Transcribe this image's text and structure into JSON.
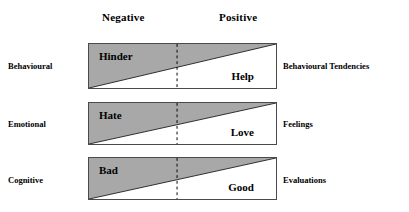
{
  "diagram": {
    "column_headers": {
      "negative": "Negative",
      "positive": "Positive"
    },
    "colors": {
      "negative_fill": "#a8a8a8",
      "positive_fill": "#ffffff",
      "box_border": "#4a4a4a",
      "divider": "#000000",
      "text": "#000000"
    },
    "divider": {
      "style": "dashed",
      "position_percent": 47
    },
    "rows": [
      {
        "id": "behavioural",
        "left_label": "Behavioural",
        "negative_word": "Hinder",
        "positive_word": "Help",
        "right_label": "Behavioural Tendencies"
      },
      {
        "id": "emotional",
        "left_label": "Emotional",
        "negative_word": "Hate",
        "positive_word": "Love",
        "right_label": "Feelings"
      },
      {
        "id": "cognitive",
        "left_label": "Cognitive",
        "negative_word": "Bad",
        "positive_word": "Good",
        "right_label": "Evaluations"
      }
    ]
  }
}
